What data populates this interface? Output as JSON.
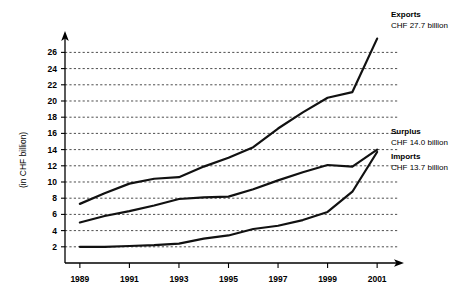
{
  "chart_data": {
    "type": "line",
    "title": "",
    "xlabel": "",
    "ylabel": "(in CHF billion)",
    "xlim": [
      1988.4,
      2001.6
    ],
    "ylim": [
      0,
      27.9
    ],
    "grid": true,
    "legend_position": "right-inline-annotations",
    "x": [
      1989,
      1990,
      1991,
      1992,
      1993,
      1994,
      1995,
      1996,
      1997,
      1998,
      1999,
      2000,
      2001
    ],
    "y_ticks": [
      2,
      4,
      6,
      8,
      10,
      12,
      14,
      16,
      18,
      20,
      22,
      24,
      26
    ],
    "y_tick_labels": [
      "2",
      "4",
      "6",
      "8",
      "10",
      "12",
      "14",
      "16",
      "18",
      "20",
      "22",
      "24",
      "26"
    ],
    "x_ticks": [
      1989,
      1991,
      1993,
      1995,
      1997,
      1999,
      2001
    ],
    "x_tick_labels": [
      "1989",
      "1991",
      "1993",
      "1995",
      "1997",
      "1999",
      "2001"
    ],
    "series": [
      {
        "name": "Exports",
        "end_label": "Exports",
        "end_value_label": "CHF 27.7 billion",
        "values": [
          7.3,
          8.6,
          9.8,
          10.4,
          10.6,
          11.9,
          13.0,
          14.3,
          16.6,
          18.6,
          20.4,
          21.1,
          27.7
        ]
      },
      {
        "name": "Surplus",
        "end_label": "Surplus",
        "end_value_label": "CHF 14.0 billion",
        "values": [
          5.0,
          5.8,
          6.4,
          7.1,
          7.9,
          8.1,
          8.2,
          9.1,
          10.2,
          11.2,
          12.1,
          11.9,
          14.0
        ]
      },
      {
        "name": "Imports",
        "end_label": "Imports",
        "end_value_label": "CHF 13.7 billion",
        "values": [
          2.0,
          2.0,
          2.1,
          2.2,
          2.4,
          3.0,
          3.4,
          4.2,
          4.6,
          5.3,
          6.3,
          8.8,
          13.7
        ]
      }
    ]
  },
  "axes": {
    "y_axis_title": "(in CHF billion)"
  },
  "annotations": [
    {
      "title": "Exports",
      "value": "CHF 27.7 billion"
    },
    {
      "title": "Surplus",
      "value": "CHF 14.0 billion"
    },
    {
      "title": "Imports",
      "value": "CHF 13.7 billion"
    }
  ]
}
